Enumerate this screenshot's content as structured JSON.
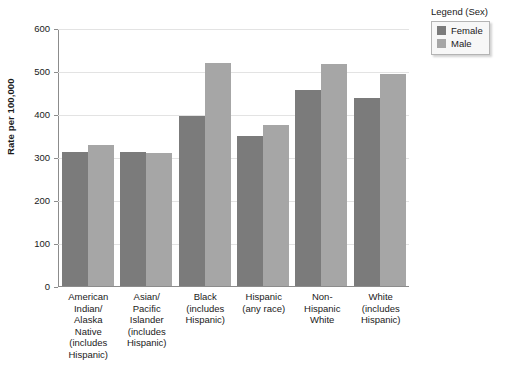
{
  "chart_data": {
    "type": "bar",
    "title": "",
    "xlabel": "",
    "ylabel": "Rate per 100,000",
    "ylim": [
      0,
      600
    ],
    "yticks": [
      0,
      100,
      200,
      300,
      400,
      500,
      600
    ],
    "ytick_labels": [
      "0",
      "100",
      "200",
      "300",
      "400",
      "500",
      "600"
    ],
    "grid": "horizontal",
    "legend_position": "top-right-outside",
    "legend_title": "Legend (Sex)",
    "categories": [
      "American Indian/ Alaska Native (includes Hispanic)",
      "Asian/ Pacific Islander (includes Hispanic)",
      "Black (includes Hispanic)",
      "Hispanic (any race)",
      "Non-Hispanic White",
      "White (includes Hispanic)"
    ],
    "category_lines": [
      [
        "American",
        "Indian/",
        "Alaska",
        "Native",
        "(includes",
        "Hispanic)"
      ],
      [
        "Asian/",
        "Pacific",
        "Islander",
        "(includes",
        "Hispanic)"
      ],
      [
        "Black",
        "(includes",
        "Hispanic)"
      ],
      [
        "Hispanic",
        "(any race)"
      ],
      [
        "Non-Hispanic",
        "White"
      ],
      [
        "White",
        "(includes",
        "Hispanic)"
      ]
    ],
    "series": [
      {
        "name": "Female",
        "color": "#7b7b7b",
        "values": [
          311,
          312,
          396,
          349,
          456,
          438
        ]
      },
      {
        "name": "Male",
        "color": "#a6a6a6",
        "values": [
          327,
          309,
          518,
          375,
          516,
          494
        ]
      }
    ]
  },
  "legend": {
    "title": "Legend (Sex)",
    "entries": [
      {
        "label": "Female",
        "color": "#7b7b7b"
      },
      {
        "label": "Male",
        "color": "#a6a6a6"
      }
    ]
  },
  "axes": {
    "y_title": "Rate per 100,000"
  }
}
